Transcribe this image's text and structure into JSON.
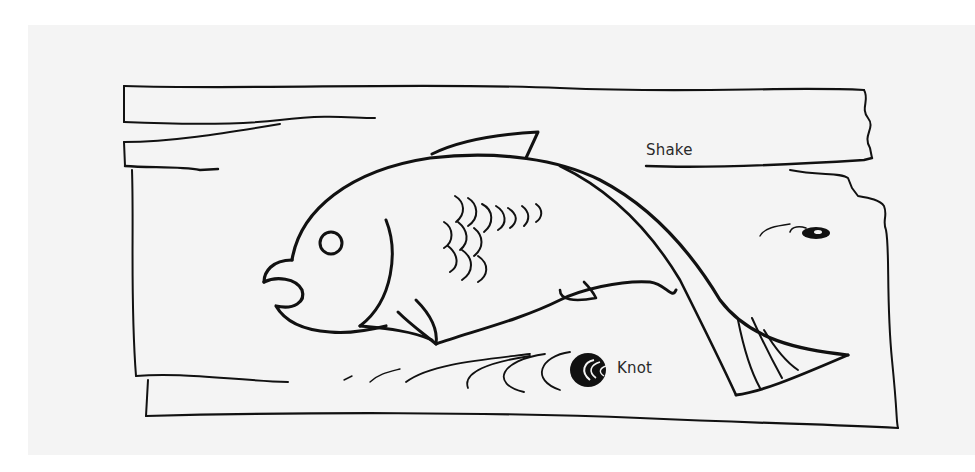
{
  "figure": {
    "labels": {
      "shake": "Shake",
      "knot": "Knot"
    },
    "colors": {
      "ink": "#111111",
      "paper": "#f4f4f4",
      "background": "#ffffff",
      "label_text": "#2a2a2a"
    }
  }
}
